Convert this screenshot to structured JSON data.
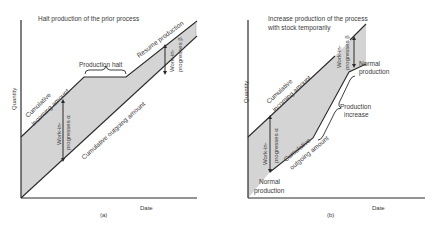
{
  "panels": [
    {
      "id": "a",
      "title": "Halt production of the prior process",
      "caption": "(a)",
      "y_axis_label": "Quantity",
      "x_axis_label": "Date",
      "incoming_label_line1": "Cumulative",
      "incoming_label_line2": "incoming amount",
      "outgoing_label": "Cumulative outgoing amount",
      "halt_label": "Production halt",
      "resume_label": "Resume production",
      "wip_alpha_line1": "Work-in-",
      "wip_alpha_line2": "progresses α",
      "wip_beta_line1": "Work-in-",
      "wip_beta_line2": "progresses β"
    },
    {
      "id": "b",
      "title_line1": "Increase production of the process",
      "title_line2": "with stock temporarily",
      "caption": "(b)",
      "y_axis_label": "Quantity",
      "x_axis_label": "Date",
      "incoming_label_line1": "Cumulative",
      "incoming_label_line2": "incoming amount",
      "outgoing_label_line1": "Cumulative",
      "outgoing_label_line2": "outgoing amount",
      "increase_label_line1": "Production",
      "increase_label_line2": "increase",
      "normal_top_line1": "Normal",
      "normal_top_line2": "production",
      "normal_bottom_line1": "Normal",
      "normal_bottom_line2": "production",
      "wip_alpha_line1": "Work-in-",
      "wip_alpha_line2": "progresses α",
      "wip_beta_line1": "Work-in-",
      "wip_beta_line2": "progresses β"
    }
  ],
  "colors": {
    "fill": "#d4d4d4",
    "line": "#2a2a2a",
    "text": "#3a3a3a"
  }
}
